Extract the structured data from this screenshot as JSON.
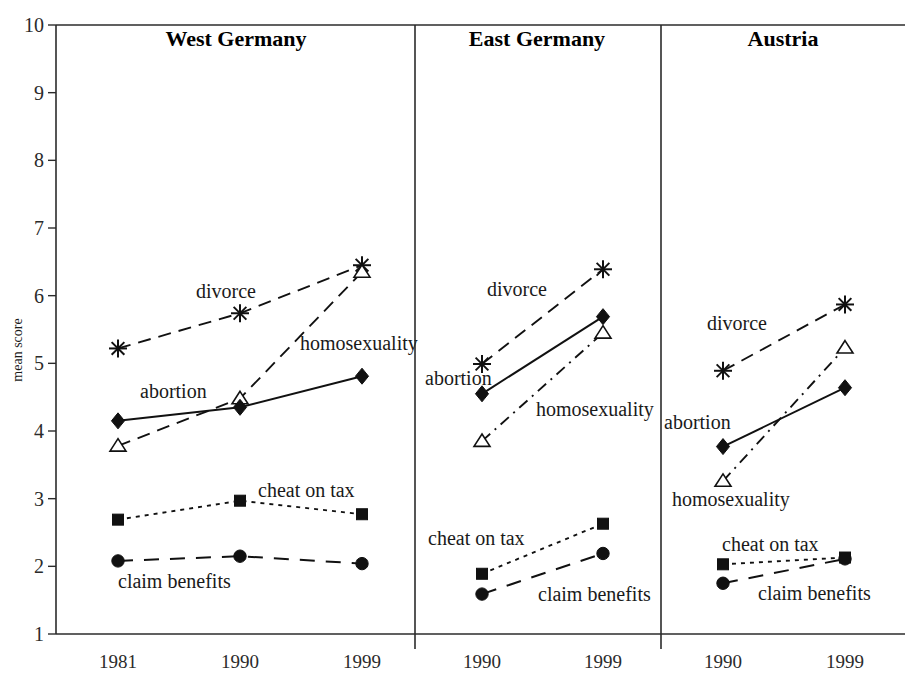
{
  "figure": {
    "y_axis_title": "mean score",
    "y_ticks": [
      "1",
      "2",
      "3",
      "4",
      "5",
      "6",
      "7",
      "8",
      "9",
      "10"
    ],
    "y_range": [
      1,
      10
    ]
  },
  "panels": [
    {
      "title": "West Germany",
      "x_ticks": [
        "1981",
        "1990",
        "1999"
      ],
      "labels": {
        "divorce": "divorce",
        "homosexuality": "homosexuality",
        "abortion": "abortion",
        "cheat_on_tax": "cheat on tax",
        "claim_benefits": "claim benefits"
      }
    },
    {
      "title": "East Germany",
      "x_ticks": [
        "1990",
        "1999"
      ],
      "labels": {
        "divorce": "divorce",
        "homosexuality": "homosexuality",
        "abortion": "abortion",
        "cheat_on_tax": "cheat on tax",
        "claim_benefits": "claim benefits"
      }
    },
    {
      "title": "Austria",
      "x_ticks": [
        "1990",
        "1999"
      ],
      "labels": {
        "divorce": "divorce",
        "homosexuality": "homosexuality",
        "abortion": "abortion",
        "cheat_on_tax": "cheat on tax",
        "claim_benefits": "claim benefits"
      }
    }
  ],
  "chart_data": {
    "type": "line",
    "title": "",
    "xlabel": "",
    "ylabel": "mean score",
    "ylim": [
      1,
      10
    ],
    "grid": false,
    "legend_position": "inline-annotations",
    "panel_layout": [
      "West Germany",
      "East Germany",
      "Austria"
    ],
    "panels": [
      {
        "name": "West Germany",
        "x": [
          "1981",
          "1990",
          "1999"
        ],
        "series": [
          {
            "name": "divorce",
            "marker": "star",
            "linestyle": "dashed",
            "values": [
              5.22,
              5.74,
              6.45
            ]
          },
          {
            "name": "homosexuality",
            "marker": "triangle",
            "linestyle": "dashed",
            "values": [
              3.78,
              4.48,
              6.35
            ]
          },
          {
            "name": "abortion",
            "marker": "diamond",
            "linestyle": "solid",
            "values": [
              4.15,
              4.35,
              4.81
            ]
          },
          {
            "name": "cheat on tax",
            "marker": "square",
            "linestyle": "dotted",
            "values": [
              2.69,
              2.97,
              2.77
            ]
          },
          {
            "name": "claim benefits",
            "marker": "circle",
            "linestyle": "long-dashed",
            "values": [
              2.08,
              2.15,
              2.04
            ]
          }
        ]
      },
      {
        "name": "East Germany",
        "x": [
          "1990",
          "1999"
        ],
        "series": [
          {
            "name": "divorce",
            "marker": "star",
            "linestyle": "dashed",
            "values": [
              4.99,
              6.39
            ]
          },
          {
            "name": "homosexuality",
            "marker": "triangle",
            "linestyle": "dash-dot",
            "values": [
              3.85,
              5.45
            ]
          },
          {
            "name": "abortion",
            "marker": "diamond",
            "linestyle": "solid",
            "values": [
              4.55,
              5.69
            ]
          },
          {
            "name": "cheat on tax",
            "marker": "square",
            "linestyle": "dotted",
            "values": [
              1.89,
              2.63
            ]
          },
          {
            "name": "claim benefits",
            "marker": "circle",
            "linestyle": "long-dashed",
            "values": [
              1.59,
              2.19
            ]
          }
        ]
      },
      {
        "name": "Austria",
        "x": [
          "1990",
          "1999"
        ],
        "series": [
          {
            "name": "divorce",
            "marker": "star",
            "linestyle": "dashed",
            "values": [
              4.89,
              5.87
            ]
          },
          {
            "name": "homosexuality",
            "marker": "triangle",
            "linestyle": "dash-dot",
            "values": [
              3.26,
              5.23
            ]
          },
          {
            "name": "abortion",
            "marker": "diamond",
            "linestyle": "solid",
            "values": [
              3.77,
              4.64
            ]
          },
          {
            "name": "cheat on tax",
            "marker": "square",
            "linestyle": "dotted",
            "values": [
              2.03,
              2.13
            ]
          },
          {
            "name": "claim benefits",
            "marker": "circle",
            "linestyle": "long-dashed",
            "values": [
              1.75,
              2.11
            ]
          }
        ]
      }
    ]
  },
  "annotations": {
    "west": {
      "divorce": {
        "text": "divorce",
        "x": 196,
        "y": 298
      },
      "homosexuality": {
        "text": "homosexuality",
        "x": 300,
        "y": 350
      },
      "abortion": {
        "text": "abortion",
        "x": 140,
        "y": 398
      },
      "cheat_on_tax": {
        "text": "cheat on tax",
        "x": 258,
        "y": 497
      },
      "claim_benefits": {
        "text": "claim benefits",
        "x": 118,
        "y": 588
      }
    },
    "east": {
      "divorce": {
        "text": "divorce",
        "x": 487,
        "y": 296
      },
      "homosexuality": {
        "text": "homosexuality",
        "x": 536,
        "y": 416
      },
      "abortion": {
        "text": "abortion",
        "x": 425,
        "y": 385
      },
      "cheat_on_tax": {
        "text": "cheat on tax",
        "x": 428,
        "y": 545
      },
      "claim_benefits": {
        "text": "claim benefits",
        "x": 538,
        "y": 601
      }
    },
    "austria": {
      "divorce": {
        "text": "divorce",
        "x": 707,
        "y": 330
      },
      "homosexuality": {
        "text": "homosexuality",
        "x": 672,
        "y": 506
      },
      "abortion": {
        "text": "abortion",
        "x": 664,
        "y": 429
      },
      "cheat_on_tax": {
        "text": "cheat on tax",
        "x": 722,
        "y": 551
      },
      "claim_benefits": {
        "text": "claim benefits",
        "x": 758,
        "y": 600
      }
    }
  },
  "colors": {
    "ink": "#111111",
    "axis": "#2b2b2b",
    "background": "#ffffff"
  }
}
